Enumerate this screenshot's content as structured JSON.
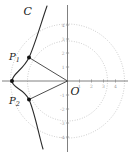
{
  "figure": {
    "labels": {
      "curve": "C",
      "origin": "O",
      "point1_base": "P",
      "point1_sub": "1",
      "point2_base": "P",
      "point2_sub": "2"
    },
    "colors": {
      "background": "#ffffff",
      "curve": "#2b2b2b",
      "segment": "#3a3a3a",
      "axis": "#606060",
      "tick_mark": "#8a8a8a",
      "tick_label": "#9a9a9a",
      "dotted_circle": "#bdbdbd",
      "dot": "#111111",
      "label_text": "#1a1a1a"
    },
    "axes": {
      "origin_px": {
        "x": 67.5,
        "y": 81
      },
      "y_ticks": [
        {
          "label": "4",
          "y": 25
        },
        {
          "label": "3",
          "y": 39
        },
        {
          "label": "2",
          "y": 53
        },
        {
          "label": "1",
          "y": 67
        },
        {
          "label": "-1",
          "y": 95
        },
        {
          "label": "-2",
          "y": 109
        },
        {
          "label": "-3",
          "y": 123
        },
        {
          "label": "-4",
          "y": 137
        }
      ],
      "x_ticks": [
        {
          "label": "1",
          "x": 79.5
        },
        {
          "label": "2",
          "x": 91.5
        },
        {
          "label": "3",
          "x": 103.5
        },
        {
          "label": "4",
          "x": 115.5
        }
      ]
    },
    "points_px": [
      {
        "name": "P1",
        "x": 29,
        "y": 57.5
      },
      {
        "name": "P2",
        "x": 29,
        "y": 99.5
      },
      {
        "name": "vertex",
        "x": 12,
        "y": 81
      }
    ],
    "circles_px": [
      {
        "name": "inner",
        "r": 40
      },
      {
        "name": "outer",
        "r": 57
      }
    ]
  }
}
